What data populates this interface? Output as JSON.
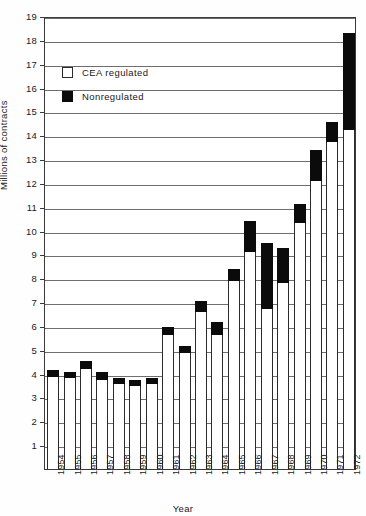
{
  "chart_data": {
    "type": "bar",
    "title": "",
    "xlabel": "Year",
    "ylabel": "Millions of contracts",
    "ylim": [
      0,
      19
    ],
    "ytick_step": 1,
    "grid": true,
    "stacked": true,
    "legend_position": "upper-left",
    "categories": [
      "1954",
      "1955",
      "1956",
      "1957",
      "1958",
      "1959",
      "1960",
      "1961",
      "1962",
      "1963",
      "1964",
      "1965",
      "1966",
      "1967",
      "1968",
      "1969",
      "1970",
      "1971",
      "1972"
    ],
    "yticks": [
      "1",
      "2",
      "3",
      "4",
      "5",
      "6",
      "7",
      "8",
      "9",
      "10",
      "11",
      "12",
      "13",
      "14",
      "15",
      "16",
      "17",
      "18",
      "19"
    ],
    "series": [
      {
        "name": "CEA regulated",
        "color": "#ffffff",
        "values": [
          3.85,
          3.8,
          4.2,
          3.75,
          3.55,
          3.5,
          3.55,
          5.6,
          4.85,
          6.6,
          5.6,
          7.9,
          9.1,
          6.7,
          7.8,
          10.3,
          12.1,
          13.7,
          14.2
        ]
      },
      {
        "name": "Nonregulated",
        "color": "#0b0b0b",
        "values": [
          0.3,
          0.25,
          0.35,
          0.3,
          0.25,
          0.25,
          0.25,
          0.35,
          0.3,
          0.45,
          0.55,
          0.5,
          1.3,
          2.8,
          1.45,
          0.8,
          1.3,
          0.85,
          4.1
        ]
      }
    ],
    "totals": [
      4.15,
      4.05,
      4.55,
      4.05,
      3.8,
      3.75,
      3.8,
      5.95,
      5.15,
      7.05,
      6.15,
      8.4,
      10.4,
      9.5,
      9.25,
      11.1,
      13.4,
      14.55,
      18.3
    ]
  },
  "legend": {
    "items": [
      {
        "label": "CEA regulated",
        "style": "open"
      },
      {
        "label": "Nonregulated",
        "style": "filled"
      }
    ]
  }
}
